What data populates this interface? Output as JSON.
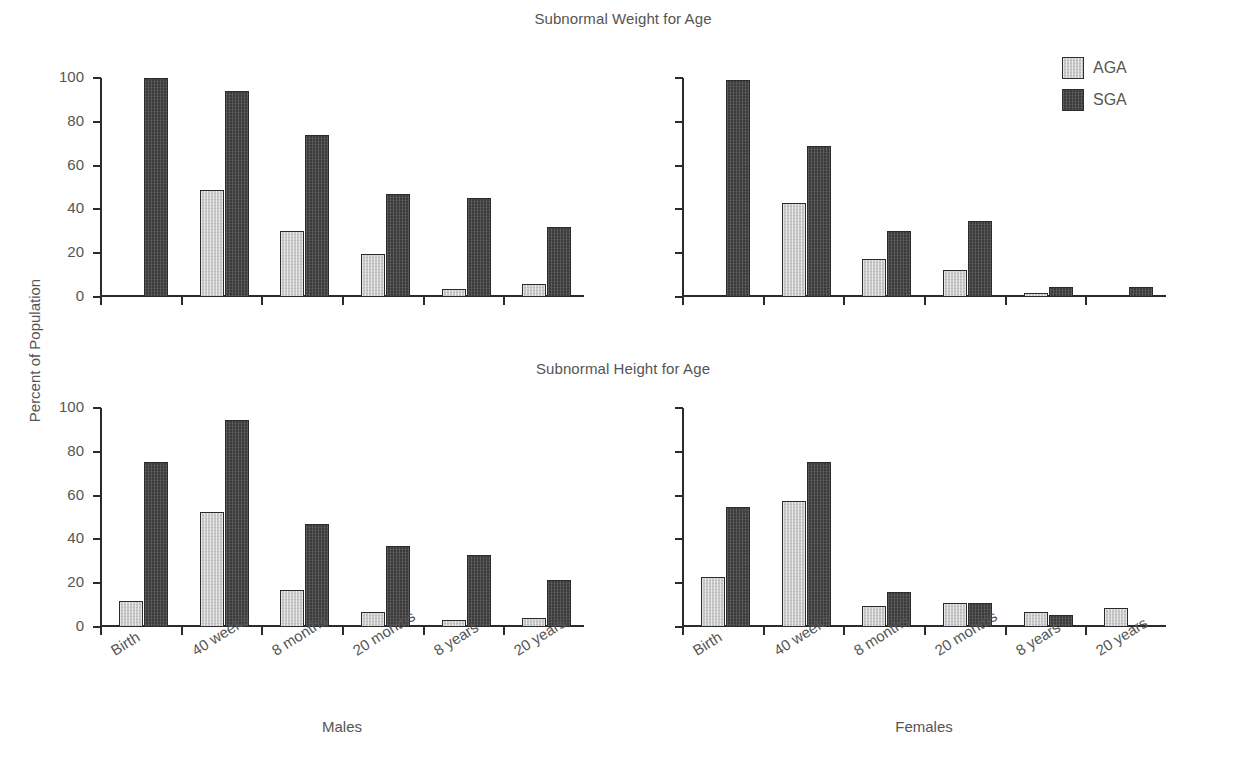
{
  "figure": {
    "ylabel": "Percent of Population",
    "titles": {
      "weight": "Subnormal Weight for Age",
      "height": "Subnormal Height for Age"
    },
    "panel_titles": {
      "males": "Males",
      "females": "Females"
    }
  },
  "legend": {
    "position": "top-right",
    "entries": [
      {
        "label": "AGA",
        "color": "#c9c9c9",
        "swatch": "aga-swatch"
      },
      {
        "label": "SGA",
        "color": "#3c3c3c",
        "swatch": "sga-swatch"
      }
    ]
  },
  "axis": {
    "ytick_labels": [
      "100",
      "80",
      "60",
      "40",
      "20",
      "0"
    ],
    "ytick_values": [
      100,
      80,
      60,
      40,
      20,
      0
    ],
    "ymin": 0,
    "ymax": 100
  },
  "chart_data": [
    {
      "id": "weight-males",
      "type": "bar",
      "title": "Subnormal Weight for Age",
      "xlabel": "Males",
      "ylabel": "Percent of Population",
      "categories": [
        "Birth",
        "40 weeks",
        "8 months",
        "20 months",
        "8 years",
        "20 years"
      ],
      "series": [
        {
          "name": "AGA",
          "color": "#c9c9c9",
          "values": [
            0,
            49,
            30,
            19.5,
            3.5,
            6
          ]
        },
        {
          "name": "SGA",
          "color": "#3c3c3c",
          "values": [
            100,
            94,
            74,
            47,
            45,
            32
          ]
        }
      ],
      "ylim": [
        0,
        100
      ],
      "grid": false,
      "legend": "top-right"
    },
    {
      "id": "weight-females",
      "type": "bar",
      "title": "Subnormal Weight for Age",
      "xlabel": "Females",
      "ylabel": "Percent of Population",
      "categories": [
        "Birth",
        "40 weeks",
        "8 months",
        "20 months",
        "8 years",
        "20 years"
      ],
      "series": [
        {
          "name": "AGA",
          "color": "#c9c9c9",
          "values": [
            0,
            43,
            17.5,
            12.5,
            2,
            1
          ]
        },
        {
          "name": "SGA",
          "color": "#3c3c3c",
          "values": [
            99,
            69,
            30,
            34.5,
            4.5,
            4.5
          ]
        }
      ],
      "ylim": [
        0,
        100
      ],
      "grid": false,
      "legend": "top-right"
    },
    {
      "id": "height-males",
      "type": "bar",
      "title": "Subnormal Height for Age",
      "xlabel": "Males",
      "ylabel": "Percent of Population",
      "categories": [
        "Birth",
        "40 weeks",
        "8 months",
        "20 months",
        "8 years",
        "20 years"
      ],
      "series": [
        {
          "name": "AGA",
          "color": "#c9c9c9",
          "values": [
            12,
            52.5,
            17,
            7,
            3,
            4
          ]
        },
        {
          "name": "SGA",
          "color": "#3c3c3c",
          "values": [
            75.5,
            94.5,
            47,
            37,
            33,
            21.5
          ]
        }
      ],
      "ylim": [
        0,
        100
      ],
      "grid": false,
      "legend": "top-right"
    },
    {
      "id": "height-females",
      "type": "bar",
      "title": "Subnormal Height for Age",
      "xlabel": "Females",
      "ylabel": "Percent of Population",
      "categories": [
        "Birth",
        "40 weeks",
        "8 months",
        "20 months",
        "8 years",
        "20 years"
      ],
      "series": [
        {
          "name": "AGA",
          "color": "#c9c9c9",
          "values": [
            23,
            57.5,
            9.5,
            11,
            7,
            8.5
          ]
        },
        {
          "name": "SGA",
          "color": "#3c3c3c",
          "values": [
            55,
            75.5,
            16,
            11,
            5.5,
            0
          ]
        }
      ],
      "ylim": [
        0,
        100
      ],
      "grid": false,
      "legend": "top-right"
    }
  ]
}
